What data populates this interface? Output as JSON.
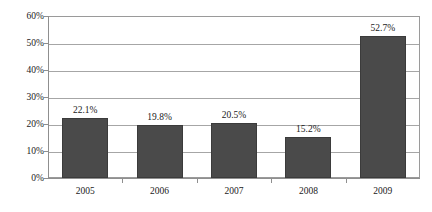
{
  "chart_data": {
    "type": "bar",
    "title": "",
    "subtitle": "",
    "xlabel": "",
    "ylabel": "",
    "categories": [
      "2005",
      "2006",
      "2007",
      "2008",
      "2009"
    ],
    "values": [
      22.1,
      19.8,
      20.5,
      15.2,
      52.7
    ],
    "data_labels": [
      "22.1%",
      "19.8%",
      "20.5%",
      "15.2%",
      "52.7%"
    ],
    "ylim": [
      0,
      60
    ],
    "y_ticks": [
      0,
      10,
      20,
      30,
      40,
      50,
      60
    ],
    "y_tick_labels": [
      "0%",
      "10%",
      "20%",
      "30%",
      "40%",
      "50%",
      "60%"
    ],
    "grid": true,
    "grid_axis": "y",
    "legend": false,
    "legend_position": "none",
    "series": [
      {
        "name": "",
        "values": [
          22.1,
          19.8,
          20.5,
          15.2,
          52.7
        ],
        "color": "#4a4a4a"
      }
    ],
    "colors": {
      "bar_fill": "#4a4a4a",
      "bar_border": "#3b3b3b",
      "gridline": "#a6a6a6",
      "axis": "#8f8f8f",
      "plot_border": "#9a9a9a",
      "background": "#ffffff",
      "text": "#1a1a1a"
    }
  }
}
